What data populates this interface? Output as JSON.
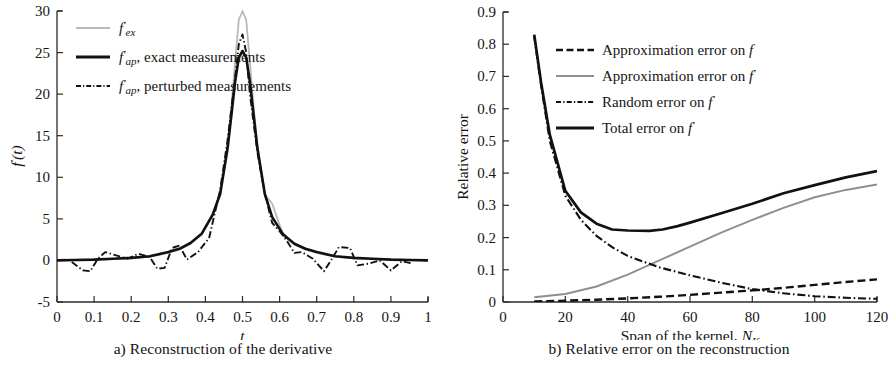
{
  "figure": {
    "panels": [
      "a",
      "b"
    ]
  },
  "panel_a": {
    "caption": "a) Reconstruction of the derivative",
    "ylabel": "f′(t)",
    "xlabel": "t",
    "xticks": [
      "0",
      "0.1",
      "0.2",
      "0.3",
      "0.4",
      "0.5",
      "0.6",
      "0.7",
      "0.8",
      "0.9",
      "1"
    ],
    "yticks": [
      "-5",
      "0",
      "5",
      "10",
      "15",
      "20",
      "25",
      "30"
    ],
    "legend": [
      {
        "label": "f′ex",
        "style": "solid",
        "color": "#b9b9b9"
      },
      {
        "label": "f′ap, exact measurements",
        "style": "solid",
        "color": "#111111"
      },
      {
        "label": "f′ap, perturbed measurements",
        "style": "dashdot",
        "color": "#111111"
      }
    ]
  },
  "panel_b": {
    "caption": "b) Relative error on the reconstruction",
    "ylabel": "Relative error",
    "xlabel": "Span of the kernel, NK",
    "xticks": [
      "0",
      "20",
      "40",
      "60",
      "80",
      "100",
      "120"
    ],
    "yticks": [
      "0",
      "0.1",
      "0.2",
      "0.3",
      "0.4",
      "0.5",
      "0.6",
      "0.7",
      "0.8",
      "0.9"
    ],
    "legend": [
      {
        "label": "Approximation error on f",
        "style": "dashed",
        "color": "#111111"
      },
      {
        "label": "Approximation error on f′",
        "style": "solid",
        "color": "#8f8f8f"
      },
      {
        "label": "Random error on f′",
        "style": "dashdot",
        "color": "#111111"
      },
      {
        "label": "Total error on f′",
        "style": "solid",
        "color": "#111111"
      }
    ]
  },
  "chart_data": [
    {
      "type": "line",
      "panel": "a",
      "title": "a) Reconstruction of the derivative",
      "xlabel": "t",
      "ylabel": "f'(t)",
      "xlim": [
        0,
        1
      ],
      "ylim": [
        -5,
        30
      ],
      "xticks": [
        0,
        0.1,
        0.2,
        0.3,
        0.4,
        0.5,
        0.6,
        0.7,
        0.8,
        0.9,
        1
      ],
      "yticks": [
        -5,
        0,
        5,
        10,
        15,
        20,
        25,
        30
      ],
      "grid": false,
      "legend_position": "upper-left",
      "series": [
        {
          "name": "f'_ex",
          "style": "solid",
          "color": "#b9b9b9",
          "description": "Exact derivative: sharp symmetric peak of height 30 at t=0.5, near zero elsewhere",
          "x": [
            0.0,
            0.05,
            0.1,
            0.15,
            0.2,
            0.25,
            0.3,
            0.33,
            0.36,
            0.39,
            0.42,
            0.44,
            0.46,
            0.47,
            0.48,
            0.49,
            0.5,
            0.51,
            0.52,
            0.53,
            0.54,
            0.56,
            0.58,
            0.61,
            0.64,
            0.67,
            0.7,
            0.75,
            0.8,
            0.85,
            0.9,
            0.95,
            1.0
          ],
          "y": [
            0.0,
            0.05,
            0.1,
            0.15,
            0.25,
            0.45,
            0.9,
            1.3,
            2.0,
            3.1,
            5.4,
            8.0,
            14.0,
            18.5,
            24.0,
            29.0,
            30.0,
            29.0,
            24.0,
            18.5,
            14.0,
            8.0,
            5.0,
            3.0,
            1.9,
            1.3,
            0.9,
            0.45,
            0.25,
            0.15,
            0.1,
            0.05,
            0.0
          ]
        },
        {
          "name": "f'_ap, exact measurements",
          "style": "solid",
          "color": "#111111",
          "description": "Approximation from exact data: smoothed peak with reduced height 25.2 at t=0.5",
          "x": [
            0.0,
            0.05,
            0.1,
            0.15,
            0.2,
            0.25,
            0.3,
            0.33,
            0.36,
            0.39,
            0.42,
            0.44,
            0.46,
            0.47,
            0.48,
            0.49,
            0.5,
            0.51,
            0.52,
            0.53,
            0.54,
            0.56,
            0.58,
            0.61,
            0.64,
            0.67,
            0.7,
            0.75,
            0.8,
            0.85,
            0.9,
            0.95,
            1.0
          ],
          "y": [
            0.0,
            0.05,
            0.1,
            0.2,
            0.3,
            0.5,
            1.0,
            1.4,
            2.1,
            3.2,
            5.5,
            8.0,
            13.5,
            17.5,
            21.5,
            24.4,
            25.2,
            24.4,
            21.5,
            17.5,
            13.5,
            8.0,
            5.2,
            3.1,
            2.0,
            1.4,
            1.0,
            0.5,
            0.3,
            0.2,
            0.1,
            0.05,
            0.0
          ]
        },
        {
          "name": "f'_ap, perturbed measurements",
          "style": "dashdot",
          "color": "#111111",
          "description": "Approximation from noisy data: peak 27.2 at t=0.5, oscillations of amplitude ~1.5 in the flat regions",
          "x": [
            0.04,
            0.07,
            0.09,
            0.11,
            0.13,
            0.16,
            0.19,
            0.22,
            0.25,
            0.27,
            0.29,
            0.31,
            0.33,
            0.35,
            0.38,
            0.41,
            0.44,
            0.46,
            0.48,
            0.49,
            0.5,
            0.51,
            0.52,
            0.54,
            0.56,
            0.58,
            0.6,
            0.62,
            0.64,
            0.66,
            0.69,
            0.72,
            0.74,
            0.76,
            0.79,
            0.81,
            0.84,
            0.87,
            0.9,
            0.93,
            0.96
          ],
          "y": [
            -0.2,
            -1.2,
            -1.3,
            0.2,
            1.0,
            0.6,
            0.2,
            0.8,
            0.4,
            -1.0,
            -0.9,
            1.5,
            1.8,
            0.1,
            1.0,
            2.7,
            8.5,
            14.5,
            22.0,
            26.0,
            27.2,
            25.0,
            20.0,
            13.0,
            8.0,
            4.5,
            3.5,
            2.2,
            0.9,
            1.0,
            0.2,
            -1.3,
            0.1,
            1.6,
            1.5,
            -0.6,
            -0.4,
            0.0,
            -1.2,
            -0.1,
            -0.4
          ]
        }
      ]
    },
    {
      "type": "line",
      "panel": "b",
      "title": "b) Relative error on the reconstruction",
      "xlabel": "Span of the kernel, N_K",
      "ylabel": "Relative error",
      "xlim": [
        0,
        120
      ],
      "ylim": [
        0,
        0.9
      ],
      "xticks": [
        0,
        20,
        40,
        60,
        80,
        100,
        120
      ],
      "yticks": [
        0,
        0.1,
        0.2,
        0.3,
        0.4,
        0.5,
        0.6,
        0.7,
        0.8,
        0.9
      ],
      "grid": false,
      "legend_position": "upper-right",
      "series": [
        {
          "name": "Approximation error on f",
          "style": "dashed",
          "color": "#111111",
          "x": [
            10,
            20,
            30,
            40,
            50,
            60,
            70,
            80,
            90,
            100,
            110,
            120
          ],
          "y": [
            0.002,
            0.004,
            0.007,
            0.011,
            0.016,
            0.022,
            0.029,
            0.036,
            0.044,
            0.053,
            0.062,
            0.07
          ]
        },
        {
          "name": "Approximation error on f'",
          "style": "solid",
          "color": "#8f8f8f",
          "x": [
            10,
            20,
            30,
            40,
            50,
            60,
            70,
            80,
            90,
            100,
            110,
            120
          ],
          "y": [
            0.015,
            0.025,
            0.048,
            0.085,
            0.128,
            0.172,
            0.215,
            0.255,
            0.292,
            0.325,
            0.348,
            0.365
          ]
        },
        {
          "name": "Random error on f'",
          "style": "dashdot",
          "color": "#111111",
          "x": [
            10,
            15,
            20,
            25,
            30,
            35,
            40,
            50,
            60,
            70,
            80,
            90,
            100,
            110,
            120
          ],
          "y": [
            0.825,
            0.47,
            0.33,
            0.255,
            0.205,
            0.17,
            0.143,
            0.108,
            0.083,
            0.06,
            0.04,
            0.027,
            0.018,
            0.013,
            0.01
          ]
        },
        {
          "name": "Total error on f'",
          "style": "solid",
          "color": "#111111",
          "x": [
            10,
            15,
            20,
            25,
            30,
            35,
            40,
            47,
            55,
            62,
            70,
            80,
            90,
            100,
            110,
            120
          ],
          "y": [
            0.83,
            0.48,
            0.345,
            0.278,
            0.243,
            0.228,
            0.223,
            0.221,
            0.228,
            0.24,
            0.258,
            0.285,
            0.312,
            0.338,
            0.362,
            0.382
          ]
        }
      ],
      "annotations": [
        {
          "text": "Total error minimum ≈ 0.22 near N_K ≈ 47"
        },
        {
          "text": "Random error and approximation error on f cross near N_K ≈ 78"
        }
      ]
    }
  ]
}
